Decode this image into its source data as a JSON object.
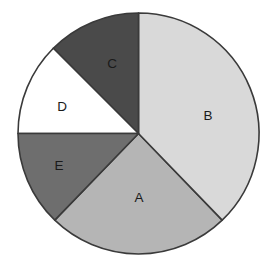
{
  "chart_data": {
    "type": "pie",
    "title": "",
    "subtitle": "",
    "xlabel": "",
    "ylabel": "",
    "grid": false,
    "legend": "none",
    "labels_position": "inside-slices",
    "start_angle_deg": 0,
    "direction": "clockwise",
    "categories": [
      "A",
      "B",
      "C",
      "D",
      "E"
    ],
    "values": [
      24.4,
      37.8,
      12.5,
      12.5,
      12.8
    ],
    "slices": [
      {
        "label": "A",
        "value": 24.4,
        "angle_deg": 88,
        "start_angle_deg": 136,
        "end_angle_deg": 224,
        "color": "#b5b5b5",
        "label_x": 139,
        "label_y": 198
      },
      {
        "label": "B",
        "value": 37.8,
        "angle_deg": 136,
        "start_angle_deg": 0,
        "end_angle_deg": 136,
        "color": "#d9d9d9",
        "label_x": 208,
        "label_y": 116
      },
      {
        "label": "C",
        "value": 12.5,
        "angle_deg": 45,
        "start_angle_deg": 315,
        "end_angle_deg": 360,
        "color": "#4a4a4a",
        "label_x": 112,
        "label_y": 64
      },
      {
        "label": "D",
        "value": 12.5,
        "angle_deg": 45,
        "start_angle_deg": 270,
        "end_angle_deg": 315,
        "color": "#ffffff",
        "label_x": 62,
        "label_y": 107
      },
      {
        "label": "E",
        "value": 12.8,
        "angle_deg": 46,
        "start_angle_deg": 224,
        "end_angle_deg": 270,
        "color": "#6e6e6e",
        "label_x": 59,
        "label_y": 166
      }
    ],
    "geometry": {
      "center_x": 138.5,
      "center_y": 133.5,
      "radius": 120.5
    },
    "style": {
      "outline_color": "#3a3a3a",
      "outline_width": 1.6,
      "background": "#ffffff",
      "label_color": "#1a1a1a"
    }
  }
}
